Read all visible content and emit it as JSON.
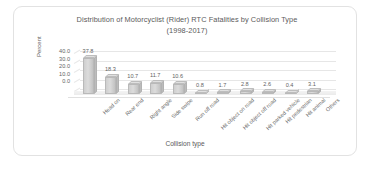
{
  "chart_data": {
    "type": "bar",
    "title": "Distribution of Motorcyclist (Rider) RTC Fatalities by Collision Type (1998-2017)",
    "title_line1": "Distribution of Motorcyclist (Rider) RTC Fatalities by Collision Type",
    "title_line2": "(1998-2017)",
    "xlabel": "Collision type",
    "ylabel": "Percent",
    "ylim": [
      0,
      40
    ],
    "yticks": [
      "0.0",
      "10.0",
      "20.0",
      "30.0",
      "40.0"
    ],
    "grid": true,
    "legend": "none",
    "style": "3d-column",
    "categories": [
      "Head on",
      "Rear end",
      "Right angle",
      "Side swipe",
      "Run off road",
      "Hit object on road",
      "Hit object off road",
      "Hit parked vehicle",
      "Hit pedestrian",
      "Hit animal",
      "Others"
    ],
    "values": [
      37.8,
      18.3,
      10.7,
      11.7,
      10.6,
      0.8,
      1.7,
      2.8,
      2.6,
      0.4,
      3.1
    ],
    "value_labels": [
      "37.8",
      "18.3",
      "10.7",
      "11.7",
      "10.6",
      "0.8",
      "1.7",
      "2.8",
      "2.6",
      "0.4",
      "3.1"
    ]
  },
  "colors": {
    "bar_face": "#d3d3d3",
    "bar_edge": "#b9b9b9",
    "grid": "#e6e6e6",
    "text": "#5b5b5b",
    "card_border": "#e2e2e2",
    "background": "#ffffff"
  }
}
